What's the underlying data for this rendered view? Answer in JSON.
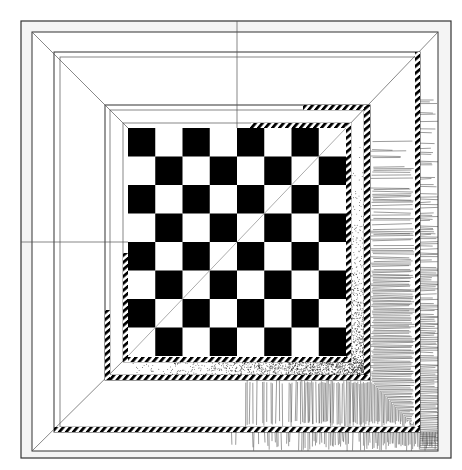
{
  "artwork": {
    "subject": "chessboard in nested perspective frames",
    "style": "black and white pen-and-ink drawing",
    "board": {
      "rows": 8,
      "cols": 8,
      "top_left_square": "black"
    },
    "colors": {
      "ink": "#000000",
      "paper": "#ffffff",
      "outer_border": "#f2f2f2",
      "line": "#333333"
    },
    "textures": [
      "diagonal-stripe-band",
      "stipple",
      "line-hatching"
    ]
  }
}
